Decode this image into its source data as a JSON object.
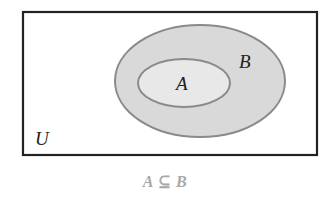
{
  "diagram": {
    "type": "venn",
    "universe_label": "U",
    "sets": [
      {
        "id": "B",
        "label": "B",
        "contains": [
          "A"
        ]
      },
      {
        "id": "A",
        "label": "A",
        "subset_of": "B"
      }
    ],
    "caption": "A ⊆ B",
    "colors": {
      "universe_border": "#222222",
      "ellipse_border": "#8a8a8a",
      "set_B_fill": "#d9d9d9",
      "set_A_fill": "#e8e8e8",
      "caption_color": "#a8a8a8",
      "label_color": "#222222"
    }
  }
}
